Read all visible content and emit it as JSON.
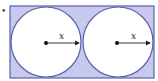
{
  "figure": {
    "bullet": "•",
    "rectangle": {
      "x": 10,
      "y": 6,
      "width": 144,
      "height": 72,
      "fill": "#c7c9ee",
      "stroke": "#5a60a8"
    },
    "circles": [
      {
        "cx": 46,
        "cy": 42,
        "r": 35,
        "fill": "#ffffff",
        "stroke": "#5a60a8",
        "radius_label": "x"
      },
      {
        "cx": 118,
        "cy": 42,
        "r": 35,
        "fill": "#ffffff",
        "stroke": "#5a60a8",
        "radius_label": "x"
      }
    ]
  }
}
